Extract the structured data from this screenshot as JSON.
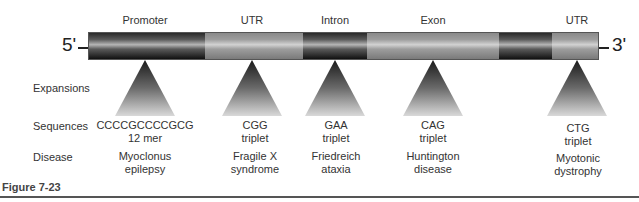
{
  "diagram": {
    "title": "",
    "ends": {
      "left": "5'",
      "right": "3'"
    },
    "bar": {
      "x_start": 88,
      "x_end": 599,
      "segments": [
        {
          "shade": "dark",
          "width": 116
        },
        {
          "shade": "light",
          "width": 99
        },
        {
          "shade": "dark",
          "width": 64
        },
        {
          "shade": "light",
          "width": 133
        },
        {
          "shade": "dark",
          "width": 53
        },
        {
          "shade": "light",
          "width": 46
        }
      ]
    },
    "regions": [
      {
        "label": "Promoter",
        "x": 145,
        "sequence_line1": "CCCCGCCCCGCG",
        "sequence_line2": "12 mer",
        "disease_line1": "Myoclonus",
        "disease_line2": "epilepsy"
      },
      {
        "label": "UTR",
        "x": 252,
        "sequence_line1": "CGG",
        "sequence_line2": "triplet",
        "disease_line1": "Fragile X",
        "disease_line2": "syndrome"
      },
      {
        "label": "Intron",
        "x": 335,
        "sequence_line1": "GAA",
        "sequence_line2": "triplet",
        "disease_line1": "Friedreich",
        "disease_line2": "ataxia"
      },
      {
        "label": "Exon",
        "x": 433,
        "sequence_line1": "CAG",
        "sequence_line2": "triplet",
        "disease_line1": "Huntington",
        "disease_line2": "disease"
      },
      {
        "label": "UTR",
        "x": 577,
        "sequence_line1": "CTG",
        "sequence_line2": "triplet",
        "disease_line1": "Myotonic",
        "disease_line2": "dystrophy"
      }
    ],
    "row_labels": {
      "expansions": "Expansions",
      "sequences": "Sequences",
      "disease": "Disease"
    },
    "caption": "Figure 7-23"
  }
}
